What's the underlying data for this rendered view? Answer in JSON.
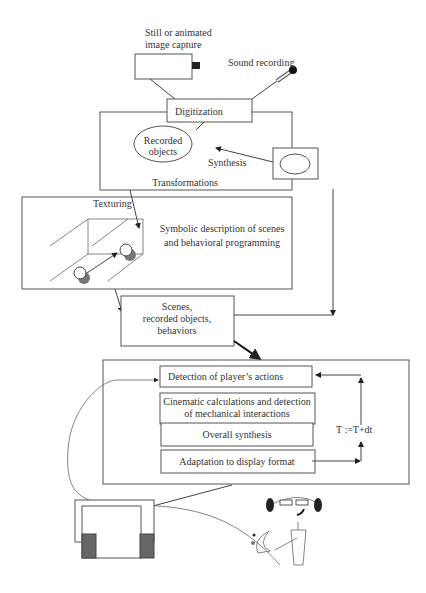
{
  "diagram": {
    "top": {
      "camera_label_line1": "Still or animated",
      "camera_label_line2": "image capture",
      "sound_label": "Sound recording",
      "digitization": "Digitization"
    },
    "transformations": {
      "recorded_objects_line1": "Recorded",
      "recorded_objects_line2": "objects",
      "synthesis": "Synthesis",
      "title": "Transformations"
    },
    "symbolic": {
      "texturing": "Texturing",
      "description_line1": "Symbolic description of scenes",
      "description_line2": "and behavioral programming"
    },
    "scenes": {
      "line1": "Scenes,",
      "line2": "recorded objects,",
      "line3": "behaviors"
    },
    "loop": {
      "step1": "Detection of player’s actions",
      "step2_line1": "Cinematic calculations and detection",
      "step2_line2": "of mechanical interactions",
      "step3": "Overall synthesis",
      "step4": "Adaptation to display format",
      "time_update": "T :=T+dt"
    }
  }
}
